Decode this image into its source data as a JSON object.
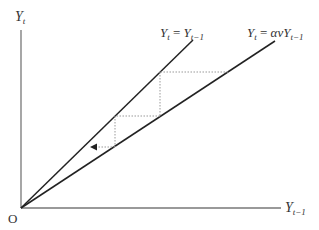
{
  "diagram": {
    "type": "cobweb-diagram",
    "axes": {
      "y_label": {
        "base": "Y",
        "sub": "t"
      },
      "x_label": {
        "base": "Y",
        "sub": "t−1"
      },
      "origin_label": "O"
    },
    "lines": [
      {
        "name": "45-degree line",
        "label_lhs": {
          "base": "Y",
          "sub": "t"
        },
        "eq": " = ",
        "label_rhs": {
          "base": "Y",
          "sub": "t−1"
        }
      },
      {
        "name": "lower line",
        "label_lhs": {
          "base": "Y",
          "sub": "t"
        },
        "eq": " = ",
        "coef": "αv",
        "label_rhs": {
          "base": "Y",
          "sub": "t−1"
        }
      }
    ],
    "staircase": {
      "style": "dotted",
      "direction": "toward origin",
      "arrow": "left"
    },
    "colors": {
      "axis": "#777777",
      "line": "#222222",
      "dotted": "#999999"
    }
  }
}
